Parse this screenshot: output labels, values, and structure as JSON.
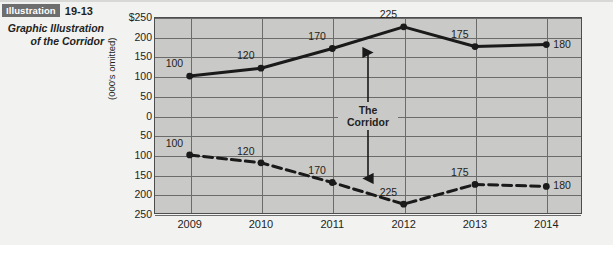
{
  "caption": {
    "badge": "Illustration",
    "number": "19-13",
    "title_line1": "Graphic Illustration",
    "title_line2": "of the Corridor"
  },
  "chart_data": {
    "type": "line",
    "title": "Graphic Illustration of the Corridor",
    "xlabel": "",
    "ylabel": "(000's omitted)",
    "categories": [
      "2009",
      "2010",
      "2011",
      "2012",
      "2013",
      "2014"
    ],
    "y_tick_labels": [
      "$250",
      "200",
      "150",
      "100",
      "50",
      "0",
      "50",
      "100",
      "150",
      "200",
      "250"
    ],
    "y_tick_values": [
      250,
      200,
      150,
      100,
      50,
      0,
      -50,
      -100,
      -150,
      -200,
      -250
    ],
    "ylim": [
      -250,
      250
    ],
    "grid": true,
    "legend": "none",
    "series": [
      {
        "name": "upper-corridor-boundary",
        "style": "solid",
        "color": "#1a1a1a",
        "values": [
          100,
          120,
          170,
          225,
          175,
          180
        ],
        "labels": [
          "100",
          "120",
          "170",
          "225",
          "175",
          "180"
        ]
      },
      {
        "name": "lower-corridor-boundary",
        "style": "dashed",
        "color": "#1a1a1a",
        "values": [
          -100,
          -120,
          -170,
          -225,
          -175,
          -180
        ],
        "labels": [
          "100",
          "120",
          "170",
          "225",
          "175",
          "180"
        ]
      }
    ],
    "annotations": [
      {
        "name": "corridor-arrow",
        "text_line1": "The",
        "text_line2": "Corridor",
        "at_category": "2011.5",
        "from": 170,
        "to": -170,
        "arrow": "double-headed"
      }
    ]
  }
}
